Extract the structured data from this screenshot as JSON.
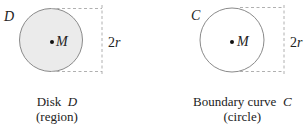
{
  "colors": {
    "disk_fill": "#ebebeb",
    "outline": "#8a8a8a",
    "dashed": "#b0b0b0",
    "text": "#222222"
  },
  "left_panel": {
    "corner_label": "D",
    "center_label": "M",
    "dimension_label": "2r",
    "caption_line1": "Disk  D",
    "caption_line2": "(region)",
    "filled": true
  },
  "right_panel": {
    "corner_label": "C",
    "center_label": "M",
    "dimension_label": "2r",
    "caption_line1": "Boundary curve  C",
    "caption_line2": "(circle)",
    "filled": false
  }
}
